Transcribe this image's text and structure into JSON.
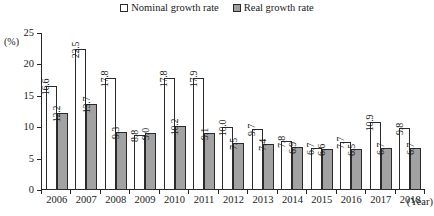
{
  "axes": {
    "y_unit_label": "(%)",
    "x_unit_label": "(Year)"
  },
  "legend": {
    "items": [
      {
        "label": "Nominal growth rate",
        "swatch": "open-square-icon",
        "color": "#ffffff"
      },
      {
        "label": "Real growth rate",
        "swatch": "filled-square-icon",
        "color": "#a0a0a0"
      }
    ]
  },
  "chart_data": {
    "type": "bar",
    "title": "",
    "xlabel": "(Year)",
    "ylabel": "(%)",
    "ylim": [
      0,
      25
    ],
    "yticks": [
      0,
      5,
      10,
      15,
      20,
      25
    ],
    "ytick_labels": [
      "0",
      "5",
      "10",
      "15",
      "20",
      "25"
    ],
    "grid": false,
    "legend_position": "top-center",
    "categories": [
      "2006",
      "2007",
      "2008",
      "2009",
      "2010",
      "2011",
      "2012",
      "2013",
      "2014",
      "2015",
      "2016",
      "2017",
      "2018"
    ],
    "series": [
      {
        "name": "Nominal growth rate",
        "color": "#ffffff",
        "values": [
          16.6,
          22.5,
          17.8,
          8.8,
          17.8,
          17.9,
          10.0,
          9.7,
          7.8,
          6.7,
          7.7,
          10.9,
          9.8
        ],
        "labels": [
          "16.6",
          "22.5",
          "17.8",
          "8.8",
          "17.8",
          "17.9",
          "10.0",
          "9.7",
          "7.8",
          "6.7",
          "7.7",
          "10.9",
          "9.8"
        ]
      },
      {
        "name": "Real growth rate",
        "color": "#a2a2a2",
        "values": [
          12.2,
          13.7,
          9.3,
          9.0,
          10.2,
          9.1,
          7.5,
          7.4,
          6.9,
          6.6,
          6.5,
          6.7,
          6.7
        ],
        "labels": [
          "12.2",
          "13.7",
          "9.3",
          "9.0",
          "10.2",
          "9.1",
          "7.5",
          "7.4",
          "6.9",
          "6.6",
          "6.5",
          "6.7",
          "6.7"
        ]
      }
    ]
  }
}
